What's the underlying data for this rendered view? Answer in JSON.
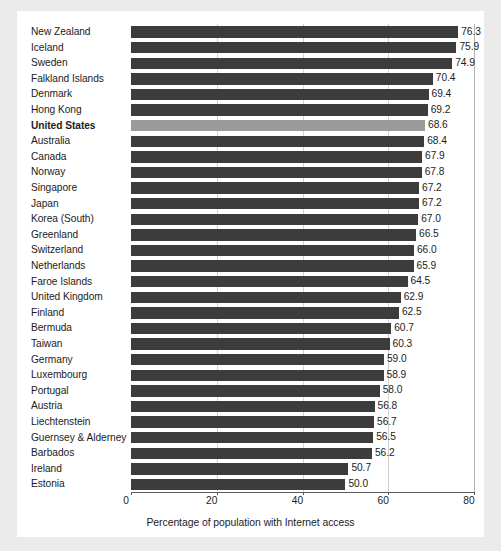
{
  "chart_data": {
    "type": "bar",
    "orientation": "horizontal",
    "title": "",
    "xlabel": "Percentage of population with Internet access",
    "ylabel": "",
    "xlim": [
      0,
      80
    ],
    "xticks": [
      "0",
      "20",
      "40",
      "60",
      "80"
    ],
    "grid": "vertical gridlines at 20, 40, 60",
    "legend": "none",
    "highlight_category": "United States",
    "colors": {
      "bar": "#3c3c3c",
      "bar_highlight": "#9b9b9b",
      "gridline": "#d2d2d2",
      "axis": "#5a5a5a",
      "plot_background": "#ffffff",
      "page_background": "#ebebeb",
      "text": "#1c1c1c"
    },
    "categories": [
      "New Zealand",
      "Iceland",
      "Sweden",
      "Falkland Islands",
      "Denmark",
      "Hong Kong",
      "United States",
      "Australia",
      "Canada",
      "Norway",
      "Singapore",
      "Japan",
      "Korea (South)",
      "Greenland",
      "Switzerland",
      "Netherlands",
      "Faroe Islands",
      "United Kingdom",
      "Finland",
      "Bermuda",
      "Taiwan",
      "Germany",
      "Luxembourg",
      "Portugal",
      "Austria",
      "Liechtenstein",
      "Guernsey & Alderney",
      "Barbados",
      "Ireland",
      "Estonia"
    ],
    "values": [
      76.3,
      75.9,
      74.9,
      70.4,
      69.4,
      69.2,
      68.6,
      68.4,
      67.9,
      67.8,
      67.2,
      67.2,
      67.0,
      66.5,
      66.0,
      65.9,
      64.5,
      62.9,
      62.5,
      60.7,
      60.3,
      59.0,
      58.9,
      58.0,
      56.8,
      56.7,
      56.5,
      56.2,
      50.7,
      50.0
    ],
    "value_labels": [
      "76.3",
      "75.9",
      "74.9",
      "70.4",
      "69.4",
      "69.2",
      "68.6",
      "68.4",
      "67.9",
      "67.8",
      "67.2",
      "67.2",
      "67.0",
      "66.5",
      "66.0",
      "65.9",
      "64.5",
      "62.9",
      "62.5",
      "60.7",
      "60.3",
      "59.0",
      "58.9",
      "58.0",
      "56.8",
      "56.7",
      "56.5",
      "56.2",
      "50.7",
      "50.0"
    ]
  }
}
